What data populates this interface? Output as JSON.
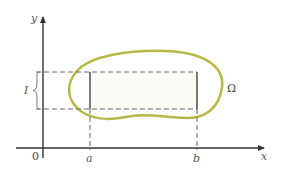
{
  "diagram": {
    "axes": {
      "x_label": "x",
      "y_label": "y",
      "origin_label": "0"
    },
    "interval_labels": {
      "a": "a",
      "b": "b",
      "I": "I"
    },
    "region_label": "Ω",
    "colors": {
      "region_boundary": "#b8b848",
      "axes": "#333333",
      "dashed": "#666666",
      "rectangle": "#333333"
    }
  }
}
